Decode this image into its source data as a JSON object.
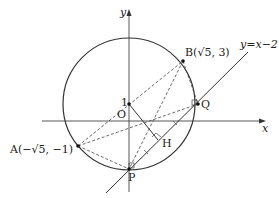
{
  "diagram": {
    "axes": {
      "x_label": "x",
      "y_label": "y",
      "origin_label": "O"
    },
    "circle": {
      "center_label": "1"
    },
    "points": {
      "A": "A(−√5, −1)",
      "B": "B(√5, 3)",
      "P": "P",
      "Q": "Q",
      "H": "H"
    },
    "line_label": "y=x−2"
  }
}
